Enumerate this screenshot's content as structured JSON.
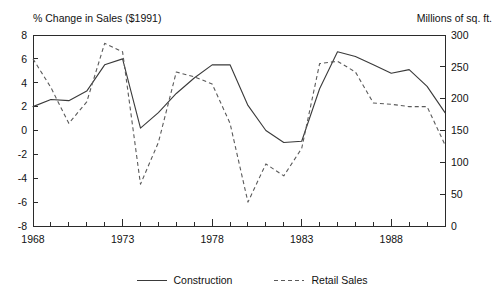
{
  "chart_data": {
    "type": "line",
    "title": "",
    "left_axis_title": "% Change in Sales ($1991)",
    "right_axis_title": "Millions of sq. ft.",
    "xlabel": "",
    "grid": false,
    "legend_position": "bottom",
    "x": [
      1968,
      1969,
      1970,
      1971,
      1972,
      1973,
      1974,
      1975,
      1976,
      1977,
      1978,
      1979,
      1980,
      1981,
      1982,
      1983,
      1984,
      1985,
      1986,
      1987,
      1988,
      1989,
      1990,
      1991
    ],
    "xlim": [
      1968,
      1991
    ],
    "xticks_labeled": [
      1968,
      1973,
      1978,
      1983,
      1988
    ],
    "xtick_labels": [
      "1968",
      "1973",
      "1978",
      "1983",
      "1988"
    ],
    "xtick_interval_years": 1,
    "ylim_left": [
      -8,
      8
    ],
    "yticks_left": [
      8,
      6,
      4,
      2,
      0,
      -2,
      -4,
      -6,
      -8
    ],
    "ytick_labels_left": [
      "8",
      "6",
      "4",
      "2",
      "0",
      "-2",
      "-4",
      "-6",
      "-8"
    ],
    "ylim_right": [
      0,
      300
    ],
    "yticks_right": [
      300,
      250,
      200,
      150,
      100,
      50,
      0
    ],
    "ytick_labels_right": [
      "300",
      "250",
      "200",
      "150",
      "100",
      "50",
      "0"
    ],
    "series": [
      {
        "name": "Construction",
        "style": "solid",
        "axis": "right",
        "color": "#3a3a3a",
        "values_left_scale": [
          2.0,
          2.6,
          2.5,
          3.3,
          5.5,
          6.0,
          0.2,
          1.5,
          3.1,
          4.4,
          5.5,
          5.5,
          2.1,
          0.0,
          -1.0,
          -0.9,
          3.5,
          6.6,
          6.2,
          5.5,
          4.8,
          5.1,
          3.7,
          1.5
        ],
        "values": [
          150,
          162,
          160,
          174,
          203,
          212,
          116,
          140,
          171,
          195,
          212,
          212,
          177,
          150,
          131,
          133,
          215,
          257,
          250,
          240,
          228,
          234,
          207,
          172
        ]
      },
      {
        "name": "Retail Sales",
        "style": "dashed",
        "axis": "left",
        "color": "#5a5a5a",
        "values": [
          6.0,
          3.6,
          0.6,
          2.4,
          7.3,
          6.6,
          -4.5,
          -1.0,
          4.9,
          4.5,
          3.9,
          0.6,
          -6.0,
          -2.8,
          -3.8,
          -1.5,
          5.6,
          5.8,
          4.9,
          2.3,
          2.2,
          2.0,
          2.0,
          -1.2
        ]
      }
    ]
  },
  "legend": {
    "items": [
      {
        "label": "Construction",
        "style": "solid"
      },
      {
        "label": "Retail Sales",
        "style": "dashed"
      }
    ]
  }
}
